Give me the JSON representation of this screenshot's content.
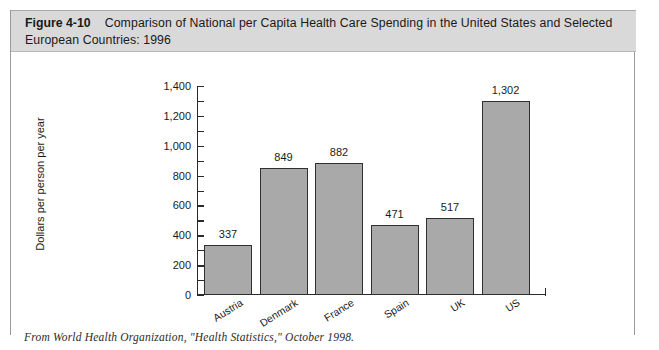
{
  "figure": {
    "number_label": "Figure 4-10",
    "caption": "Comparison of National per Capita  Health Care Spending in the United States and  Selected European Countries: 1996",
    "source_note": "From World Health Organization, \"Health Statistics,\" October 1998.",
    "band_color": "#d9d9d9",
    "bar_fill_color": "#a9a9a9",
    "bar_outline_color": "#2f2f2f",
    "axis_color": "#2a2a2a"
  },
  "chart_data": {
    "type": "bar",
    "title": "Comparison of National per Capita  Health Care Spending in the United States and  Selected European Countries: 1996",
    "xlabel": "",
    "ylabel": "Dollars per person per year",
    "categories": [
      "Austria",
      "Denmark",
      "France",
      "Spain",
      "UK",
      "US"
    ],
    "values": [
      337,
      849,
      882,
      471,
      517,
      1302
    ],
    "value_labels": [
      "337",
      "849",
      "882",
      "471",
      "517",
      "1,302"
    ],
    "ylim": [
      0,
      1400
    ],
    "ytick_step": 200,
    "yminor_step": 100,
    "ytick_labels": [
      "1,400",
      "1,200",
      "1,000",
      "800",
      "600",
      "400",
      "200",
      "0"
    ],
    "ytick_values": [
      1400,
      1200,
      1000,
      800,
      600,
      400,
      200,
      0
    ],
    "grid": false,
    "legend": false,
    "legend_position": "none"
  }
}
